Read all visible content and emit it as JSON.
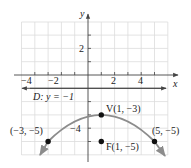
{
  "figure": {
    "x_axis_label": "x",
    "y_axis_label": "y",
    "x_tick_labels": [
      "−4",
      "−2",
      "2",
      "4"
    ],
    "y_tick_labels": [
      "2",
      "−4"
    ],
    "directrix_label": "D: y = −1",
    "points": [
      {
        "name": "vertex",
        "label": "V(1, −3)",
        "x": 1,
        "y": -3
      },
      {
        "name": "focus",
        "label": "F(1, −5)",
        "x": 1,
        "y": -5
      },
      {
        "name": "left-point",
        "label": "(−3, −5)",
        "x": -3,
        "y": -5
      },
      {
        "name": "right-point",
        "label": "(5, −5)",
        "x": 5,
        "y": -5
      }
    ],
    "colors": {
      "grid": "#dcdcdc",
      "axis": "#444444",
      "curve": "#8c8c8c",
      "point": "#111111"
    }
  }
}
